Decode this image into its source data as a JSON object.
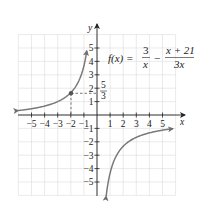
{
  "chart_data": {
    "type": "line",
    "title": "",
    "function_label": {
      "lhs": "f(x) =",
      "term1_num": "3",
      "term1_den": "x",
      "operator": "−",
      "term2_num": "x + 21",
      "term2_den": "3x"
    },
    "xlabel": "x",
    "ylabel": "y",
    "xlim": [
      -6,
      6
    ],
    "ylim": [
      -6,
      6
    ],
    "grid": true,
    "x_ticks": [
      "−5",
      "−4",
      "−3",
      "−2",
      "−1",
      "1",
      "2",
      "3",
      "4",
      "5"
    ],
    "y_ticks": [
      "5",
      "4",
      "3",
      "2",
      "1",
      "−1",
      "−2",
      "−3",
      "−4",
      "−5"
    ],
    "vertical_asymptote": 0,
    "horizontal_asymptote": -0.3333,
    "series": [
      {
        "name": "left branch",
        "x": [
          -6,
          -5,
          -4,
          -3,
          -2,
          -1.5,
          -1,
          -0.8
        ],
        "y": [
          0.33,
          0.47,
          0.67,
          1.0,
          1.67,
          2.33,
          3.67,
          4.67
        ]
      },
      {
        "name": "right branch",
        "x": [
          0.7,
          1,
          1.5,
          2,
          3,
          4,
          5,
          5.8
        ],
        "y": [
          -6.05,
          -4.33,
          -3.0,
          -2.33,
          -1.67,
          -1.33,
          -1.13,
          -1.02
        ]
      }
    ],
    "highlighted_point": {
      "x": -2,
      "y": 1.6667,
      "label_num": "5",
      "label_den": "3"
    },
    "annotations": [
      "dashed lines from point (−2, 5/3) to both axes"
    ]
  }
}
